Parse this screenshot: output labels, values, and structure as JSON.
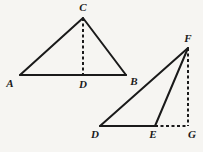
{
  "figure": {
    "background_color": "#f6f5f2",
    "stroke_color": "#1a1a1a",
    "label_color": "#1a1a1a",
    "stroke_width": 2,
    "dash_pattern": "3 2.5",
    "triangles": [
      {
        "name": "triangle-abc",
        "vertices": {
          "A": {
            "label": "A",
            "x": 20,
            "y": 75,
            "label_x": 10,
            "label_y": 83
          },
          "B": {
            "label": "B",
            "x": 126,
            "y": 75,
            "label_x": 134,
            "label_y": 81
          },
          "C": {
            "label": "C",
            "x": 83,
            "y": 18,
            "label_x": 83,
            "label_y": 7
          }
        },
        "foot": {
          "label": "D",
          "x": 83,
          "y": 75,
          "label_x": 83,
          "label_y": 84
        },
        "solid_edges": [
          {
            "name": "edge-AC",
            "from": "A",
            "to": "C"
          },
          {
            "name": "edge-CB",
            "from": "C",
            "to": "B"
          },
          {
            "name": "edge-AB",
            "from": "A",
            "to": "B"
          }
        ],
        "dashed_edges": [
          {
            "name": "altitude-CD",
            "from": "C",
            "to": "D"
          }
        ]
      },
      {
        "name": "triangle-def",
        "vertices": {
          "D": {
            "label": "D",
            "x": 100,
            "y": 126,
            "label_x": 95,
            "label_y": 134
          },
          "E": {
            "label": "E",
            "x": 155,
            "y": 126,
            "label_x": 153,
            "label_y": 134
          },
          "F": {
            "label": "F",
            "x": 188,
            "y": 48,
            "label_x": 188,
            "label_y": 38
          },
          "G": {
            "label": "G",
            "x": 188,
            "y": 126,
            "label_x": 192,
            "label_y": 134
          }
        },
        "solid_edges": [
          {
            "name": "edge-DF",
            "from": "D",
            "to": "F"
          },
          {
            "name": "edge-EF",
            "from": "E",
            "to": "F"
          },
          {
            "name": "edge-DE",
            "from": "D",
            "to": "E"
          }
        ],
        "dashed_edges": [
          {
            "name": "altitude-FG",
            "from": "F",
            "to": "G"
          },
          {
            "name": "extension-EG",
            "from": "E",
            "to": "G"
          }
        ]
      }
    ],
    "labels": [
      {
        "name": "vertex-label-A",
        "text": "A",
        "x": 10,
        "y": 83
      },
      {
        "name": "vertex-label-B",
        "text": "B",
        "x": 134,
        "y": 81
      },
      {
        "name": "vertex-label-C",
        "text": "C",
        "x": 83,
        "y": 7
      },
      {
        "name": "vertex-label-D-left",
        "text": "D",
        "x": 83,
        "y": 84
      },
      {
        "name": "vertex-label-D-right",
        "text": "D",
        "x": 95,
        "y": 134
      },
      {
        "name": "vertex-label-E",
        "text": "E",
        "x": 153,
        "y": 134
      },
      {
        "name": "vertex-label-F",
        "text": "F",
        "x": 188,
        "y": 38
      },
      {
        "name": "vertex-label-G",
        "text": "G",
        "x": 192,
        "y": 134
      }
    ]
  }
}
